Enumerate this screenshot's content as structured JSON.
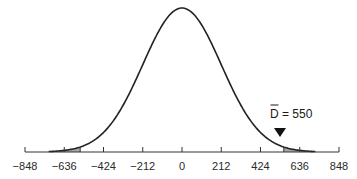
{
  "chart_data": {
    "type": "line",
    "title": "",
    "xlabel": "",
    "ylabel": "",
    "distribution": {
      "mean": 0,
      "sd": 212
    },
    "x_ticks": [
      -848,
      -636,
      -424,
      -212,
      0,
      212,
      424,
      636,
      848
    ],
    "x_tick_labels": [
      "−848",
      "−636",
      "−424",
      "−212",
      "0",
      "212",
      "424",
      "636",
      "848"
    ],
    "xlim": [
      -848,
      848
    ],
    "grid": false,
    "y_axis_shown": false,
    "shaded_regions": [
      {
        "from": -848,
        "to": -550,
        "side": "left"
      },
      {
        "from": 550,
        "to": 848,
        "side": "right"
      }
    ],
    "annotations": [
      {
        "text": "D̄ = 550",
        "x": 550,
        "marker": "down-triangle"
      }
    ],
    "colors": {
      "curve": "#222222",
      "shade": "#a6a6a6",
      "axis": "#333333"
    }
  },
  "annotation": {
    "label_bar": "D",
    "label_rest": " = 550"
  },
  "axis": {
    "ticks": [
      "−848",
      "−636",
      "−424",
      "−212",
      "0",
      "212",
      "424",
      "636",
      "848"
    ]
  }
}
